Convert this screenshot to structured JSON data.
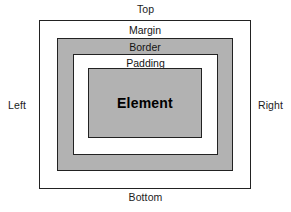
{
  "diagram": {
    "type": "nested-box-model",
    "colors": {
      "page_background": "#ffffff",
      "stroke": "#222222",
      "shaded_fill": "#b2b2b2",
      "clear_fill": "#ffffff",
      "text": "#141414"
    },
    "edge_labels": {
      "top": "Top",
      "bottom": "Bottom",
      "left": "Left",
      "right": "Right"
    },
    "boxes": {
      "margin": {
        "label": "Margin",
        "fill": "#ffffff"
      },
      "border": {
        "label": "Border",
        "fill": "#b2b2b2"
      },
      "padding": {
        "label": "Padding",
        "fill": "#ffffff"
      },
      "element": {
        "label": "Element",
        "fill": "#b2b2b2"
      }
    }
  }
}
